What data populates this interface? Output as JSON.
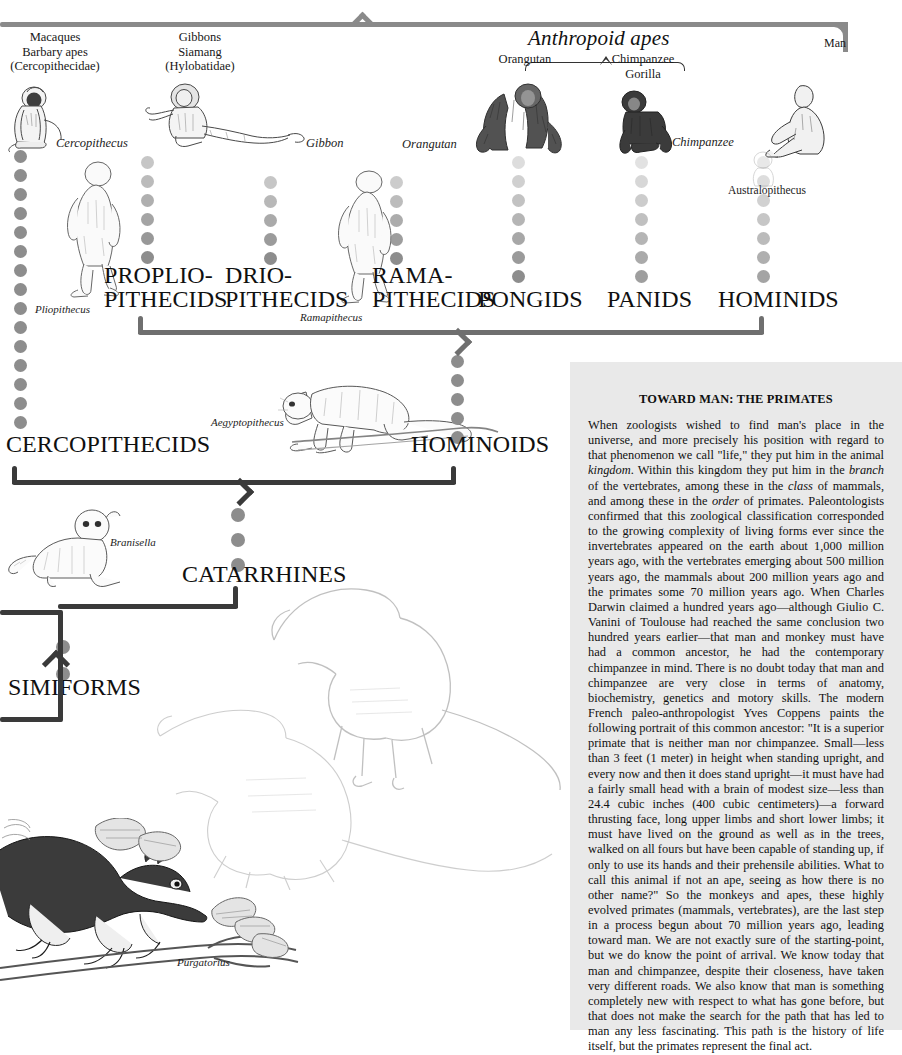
{
  "header": {
    "groups": [
      {
        "id": "cercopithecidae",
        "lines": [
          "Macaques",
          "Barbary apes",
          "(Cercopithecidae)"
        ]
      },
      {
        "id": "hylobatidae",
        "lines": [
          "Gibbons",
          "Siamang",
          "(Hylobatidae)"
        ]
      }
    ],
    "anthropoid_apes_label": "Anthropoid apes",
    "anthropoid_members": [
      {
        "id": "orangutan",
        "label": "Orangutan"
      },
      {
        "id": "chimpanzee-gorilla",
        "lines": [
          "Chimpanzee",
          "Gorilla"
        ]
      }
    ],
    "man_label": "Man"
  },
  "captions": {
    "cercopithecus": "Cercopithecus",
    "gibbon": "Gibbon",
    "orangutan": "Orangutan",
    "chimpanzee": "Chimpanzee",
    "pliopithecus": "Pliopithecus",
    "ramapithecus": "Ramapithecus",
    "australopithecus": "Australopithecus",
    "aegyptopithecus": "Aegyptopithecus",
    "branisella": "Branisella",
    "purgatorius": "Purgatorius"
  },
  "taxa": [
    {
      "id": "proplio-pithecids",
      "line1": "PROPLIO-",
      "line2": "PITHECIDS"
    },
    {
      "id": "drio-pithecids",
      "line1": "DRIO-",
      "line2": "PITHECIDS"
    },
    {
      "id": "rama-pithecids",
      "line1": "RAMA-",
      "line2": "PITHECIDS"
    },
    {
      "id": "pongids",
      "line1": "PONGIDS",
      "line2": ""
    },
    {
      "id": "panids",
      "line1": "PANIDS",
      "line2": ""
    },
    {
      "id": "hominids",
      "line1": "HOMINIDS",
      "line2": ""
    },
    {
      "id": "cercopithecids",
      "line1": "CERCOPITHECIDS",
      "line2": ""
    },
    {
      "id": "hominoids",
      "line1": "HOMINOIDS",
      "line2": ""
    },
    {
      "id": "catarrhines",
      "line1": "CATARRHINES",
      "line2": ""
    },
    {
      "id": "simiforms",
      "line1": "SIMIFORMS",
      "line2": ""
    }
  ],
  "taxon_labels": {
    "proplio_1": "PROPLIO-",
    "proplio_2": "PITHECIDS",
    "drio_1": "DRIO-",
    "drio_2": "PITHECIDS",
    "rama_1": "RAMA-",
    "rama_2": "PITHECIDS",
    "pongids": "PONGIDS",
    "panids": "PANIDS",
    "hominids": "HOMINIDS",
    "cercopithecids": "CERCOPITHECIDS",
    "hominoids": "HOMINOIDS",
    "catarrhines": "CATARRHINES",
    "simiforms": "SIMIFORMS"
  },
  "article": {
    "title": "TOWARD MAN: THE PRIMATES",
    "paragraph": "When zoologists wished to find man's place in the universe, and more precisely his position with regard to that phenomenon we call \"life,\" they put him in the animal kingdom. Within this kingdom they put him in the branch of the vertebrates, among these in the class of mammals, and among these in the order of primates. Paleontologists confirmed that this zoological classification corresponded to the growing complexity of living forms ever since the invertebrates appeared on the earth about 1,000 million years ago, with the vertebrates emerging about 500 million years ago, the mammals about 200 million years ago and the primates some 70 million years ago. When Charles Darwin claimed a hundred years ago—although Giulio C. Vanini of Toulouse had reached the same conclusion two hundred years earlier—that man and monkey must have had a common ancestor, he had the contemporary chimpanzee in mind. There is no doubt today that man and chimpanzee are very close in terms of anatomy, biochemistry, genetics and motory skills. The modern French paleo-anthropologist Yves Coppens paints the following portrait of this common ancestor: \"It is a superior primate that is neither man nor chimpanzee. Small—less than 3 feet (1 meter) in height when standing upright, and every now and then it does stand upright—it must have had a fairly small head with a brain of modest size—less than 24.4 cubic inches (400 cubic centimeters)—a forward thrusting face, long upper limbs and short lower limbs; it must have lived on the ground as well as in the trees, walked on all fours but have been capable of standing up, if only to use its hands and their prehensile abilities. What to call this animal if not an ape, seeing as how there is no other name?\" So the monkeys and apes, these highly evolved primates (mammals, vertebrates), are the last step in a process begun about 70 million years ago, leading toward man. We are not exactly sure of the starting-point, but we do know the point of arrival. We know today that man and chimpanzee, despite their closeness, have taken very different roads. We also know that man is something completely new with respect to what has gone before, but that does not make the search for the path that has led to man any less fascinating. This path is the history of life itself, but the primates represent the final act.",
    "italic_words": [
      "kingdom",
      "branch",
      "class",
      "order"
    ]
  },
  "colors": {
    "page_background": "#ffffff",
    "panel_background": "#e9e9e9",
    "bracket_light": "#8a8a8a",
    "bracket_mid": "#6f6f6f",
    "bracket_dark": "#3a3a3a",
    "dot": "#8d8d8d",
    "text": "#111111"
  },
  "dot_columns": [
    {
      "id": "cercopithecids-column",
      "x": 14,
      "top": 150,
      "count": 15,
      "size": 13,
      "gap": 19,
      "opacity_start": 1,
      "opacity_end": 1
    },
    {
      "id": "propliopithecids-column",
      "x": 141,
      "top": 156,
      "count": 6,
      "size": 13,
      "gap": 19,
      "opacity_start": 0.5,
      "opacity_end": 1
    },
    {
      "id": "driopithecids-column",
      "x": 264,
      "top": 176,
      "count": 5,
      "size": 13,
      "gap": 19,
      "opacity_start": 0.5,
      "opacity_end": 1
    },
    {
      "id": "ramapithecids-column",
      "x": 390,
      "top": 176,
      "count": 5,
      "size": 13,
      "gap": 19,
      "opacity_start": 0.45,
      "opacity_end": 1
    },
    {
      "id": "hominoids-column",
      "x": 451,
      "top": 355,
      "count": 5,
      "size": 13,
      "gap": 19,
      "opacity_start": 1,
      "opacity_end": 1
    },
    {
      "id": "pongids-column",
      "x": 512,
      "top": 156,
      "count": 7,
      "size": 13,
      "gap": 19,
      "opacity_start": 0.3,
      "opacity_end": 1
    },
    {
      "id": "panids-column",
      "x": 635,
      "top": 156,
      "count": 7,
      "size": 13,
      "gap": 19,
      "opacity_start": 0.25,
      "opacity_end": 0.85
    },
    {
      "id": "hominids-column",
      "x": 757,
      "top": 156,
      "count": 7,
      "size": 13,
      "gap": 19,
      "opacity_start": 0.2,
      "opacity_end": 0.8
    },
    {
      "id": "catarrhines-column",
      "x": 231,
      "top": 508,
      "count": 3,
      "size": 14,
      "gap": 25,
      "opacity_start": 1,
      "opacity_end": 1
    },
    {
      "id": "simiforms-column",
      "x": 56,
      "top": 640,
      "count": 2,
      "size": 14,
      "gap": 27,
      "opacity_start": 1,
      "opacity_end": 1
    }
  ]
}
